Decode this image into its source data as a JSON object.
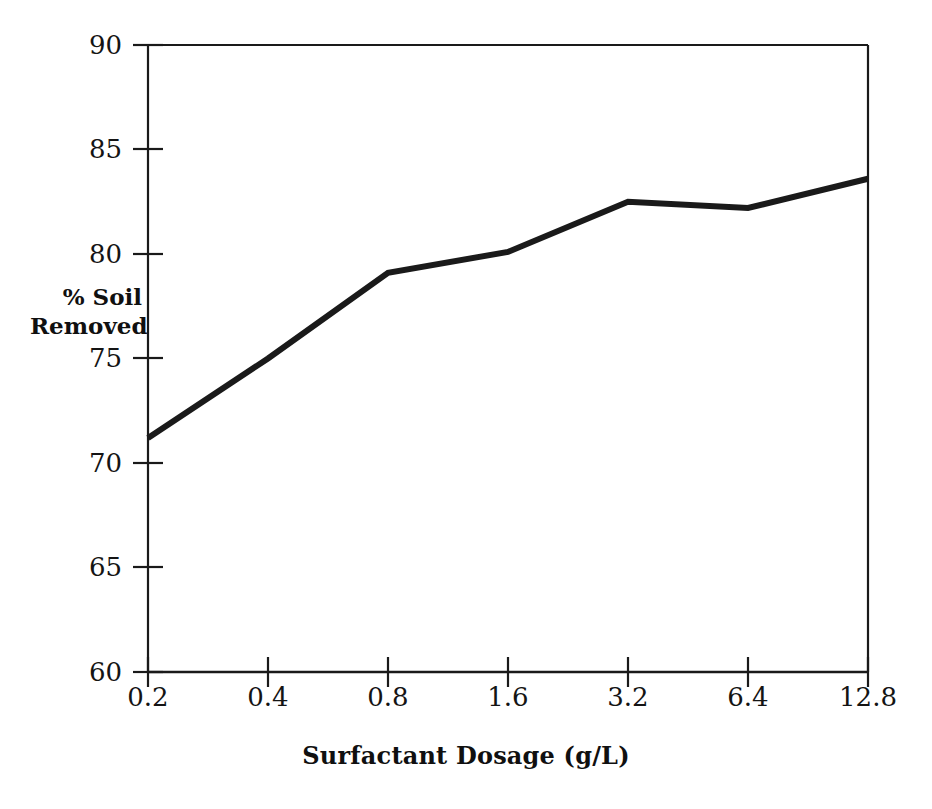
{
  "figure": {
    "clipped_header_text": "",
    "background_color": "#ffffff",
    "line_color": "#1a1a1a",
    "axis_color": "#1a1a1a"
  },
  "axes": {
    "y_title_line1": "% Soil",
    "y_title_line2": "Removed",
    "x_title": "Surfactant Dosage (g/L)",
    "y_ticks": [
      "60",
      "65",
      "70",
      "75",
      "80",
      "85",
      "90"
    ],
    "x_ticks": [
      "0.2",
      "0.4",
      "0.8",
      "1.6",
      "3.2",
      "6.4",
      "12.8"
    ]
  },
  "chart_data": {
    "type": "line",
    "title": "",
    "subtitle": "",
    "xlabel": "Surfactant Dosage (g/L)",
    "ylabel": "% Soil Removed",
    "categories": [
      "0.2",
      "0.4",
      "0.8",
      "1.6",
      "3.2",
      "6.4",
      "12.8"
    ],
    "x": [
      0.2,
      0.4,
      0.8,
      1.6,
      3.2,
      6.4,
      12.8
    ],
    "x_scale": "log2-categorical",
    "values": [
      71.2,
      75.0,
      79.1,
      80.1,
      82.5,
      82.2,
      83.6
    ],
    "series": [
      {
        "name": "% Soil Removed",
        "values": [
          71.2,
          75.0,
          79.1,
          80.1,
          82.5,
          82.2,
          83.6
        ]
      }
    ],
    "ylim": [
      60,
      90
    ],
    "ytick_step": 5,
    "grid": false,
    "legend": false,
    "legend_position": "none",
    "line_width_px": 6,
    "markers": false
  }
}
